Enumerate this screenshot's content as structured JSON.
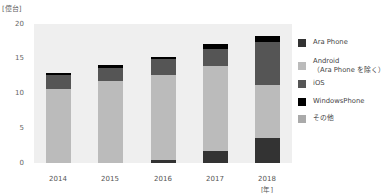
{
  "chart_data": {
    "type": "bar",
    "stacked": true,
    "title": "",
    "ylabel": "[億台]",
    "xlabel": "[年]",
    "ylim": [
      0,
      20
    ],
    "yticks": [
      0,
      5,
      10,
      15,
      20
    ],
    "grid": false,
    "legend_position": "right",
    "categories": [
      "2014",
      "2015",
      "2016",
      "2017",
      "2018"
    ],
    "series": [
      {
        "name": "Ara Phone",
        "color": "#333333",
        "values": [
          0,
          0,
          0.4,
          1.7,
          3.6
        ]
      },
      {
        "name": "Android\n（Ara Phone を除く）",
        "color": "#bbbbbb",
        "values": [
          10.7,
          11.8,
          12.3,
          12.3,
          7.6
        ]
      },
      {
        "name": "iOS",
        "color": "#555555",
        "values": [
          1.9,
          1.9,
          2.2,
          2.4,
          6.2
        ]
      },
      {
        "name": "WindowsPhone",
        "color": "#000000",
        "values": [
          0.4,
          0.4,
          0.4,
          0.7,
          0.9
        ]
      },
      {
        "name": "その他",
        "color": "#aaaaaa",
        "values": [
          0,
          0,
          0,
          0,
          0
        ]
      }
    ]
  },
  "axis": {
    "unit_label": "[億台]",
    "x_unit_label": "[年]",
    "yticks": [
      "0",
      "5",
      "10",
      "15",
      "20"
    ],
    "xticks": [
      "2014",
      "2015",
      "2016",
      "2017",
      "2018"
    ]
  },
  "legend": [
    {
      "label": "Ara Phone",
      "color": "#333333"
    },
    {
      "label": "Android\n（Ara Phone を除く）",
      "color": "#bbbbbb"
    },
    {
      "label": "iOS",
      "color": "#555555"
    },
    {
      "label": "WindowsPhone",
      "color": "#000000"
    },
    {
      "label": "その他",
      "color": "#aaaaaa"
    }
  ]
}
